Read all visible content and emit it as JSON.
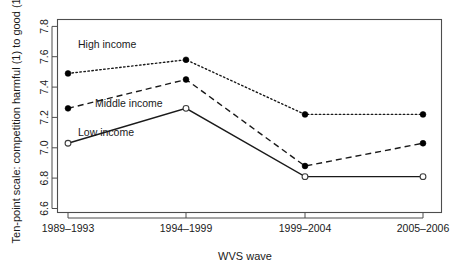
{
  "chart_data": {
    "type": "line",
    "title": "",
    "xlabel": "WVS wave",
    "ylabel": "Ten-point scale: competition harmful (1) to good (10)",
    "categories": [
      "1989–1993",
      "1994–1999",
      "1999–2004",
      "2005–2006"
    ],
    "xtick_labels": [
      "1989–1993",
      "1994–1999",
      "1999–2004",
      "2005–2006"
    ],
    "ytick_labels": [
      "6.6",
      "6.8",
      "7.0",
      "7.2",
      "7.4",
      "7.6",
      "7.8"
    ],
    "ytick_values": [
      6.6,
      6.8,
      7.0,
      7.2,
      7.4,
      7.6,
      7.8
    ],
    "ylim": [
      6.52,
      7.87
    ],
    "grid": false,
    "legend_position": "inline-annotations",
    "series": [
      {
        "name": "High income",
        "values": [
          7.49,
          7.58,
          7.22,
          7.22
        ],
        "style": "dotted",
        "marker": "filled-circle",
        "annotation": "High income"
      },
      {
        "name": "Middle income",
        "values": [
          7.26,
          7.45,
          6.88,
          7.03
        ],
        "style": "dashed",
        "marker": "filled-circle",
        "annotation": "Middle income"
      },
      {
        "name": "Low income",
        "values": [
          7.03,
          7.26,
          6.81,
          6.81
        ],
        "style": "solid",
        "marker": "open-circle",
        "annotation": "Low income"
      }
    ],
    "colors": {
      "axis": "#4d4d4d",
      "text": "#1a1a1a",
      "line": "#1a1a1a",
      "background": "#ffffff"
    }
  }
}
